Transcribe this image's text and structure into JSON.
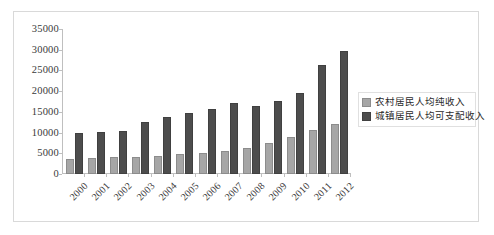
{
  "chart_data": {
    "type": "bar",
    "title": "",
    "xlabel": "",
    "ylabel": "",
    "ylim": [
      0,
      35000
    ],
    "y_ticks": [
      0,
      5000,
      10000,
      15000,
      20000,
      25000,
      30000,
      35000
    ],
    "y_tick_labels": [
      "0",
      "5000",
      "10000",
      "15000",
      "20000",
      "25000",
      "30000",
      "35000"
    ],
    "grid": false,
    "legend_position": "right",
    "categories": [
      "2000",
      "2001",
      "2002",
      "2003",
      "2004",
      "2005",
      "2006",
      "2007",
      "2008",
      "2009",
      "2010",
      "2011",
      "2012"
    ],
    "series": [
      {
        "name": "农村居民人均纯收入",
        "color": "#a6a6a6",
        "values": [
          3700,
          3900,
          4100,
          4100,
          4400,
          4800,
          5100,
          5600,
          6400,
          7400,
          9000,
          10700,
          12100
        ]
      },
      {
        "name": "城镇居民人均可支配收入",
        "color": "#4d4d4d",
        "values": [
          9900,
          10100,
          10500,
          12600,
          13800,
          14800,
          15700,
          17100,
          16400,
          17700,
          19600,
          26300,
          29600
        ]
      }
    ]
  },
  "legend": {
    "items": [
      {
        "label": "农村居民人均纯收入",
        "swatch": "rural"
      },
      {
        "label": "城镇居民人均可支配收入",
        "swatch": "urban"
      }
    ]
  }
}
